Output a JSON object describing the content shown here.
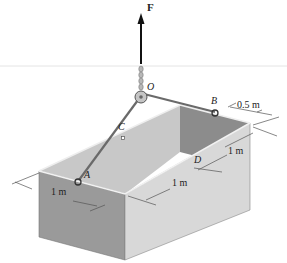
{
  "figure": {
    "force_label": "F",
    "points": {
      "O": "O",
      "A": "A",
      "B": "B",
      "C": "C",
      "D": "D"
    },
    "dimensions": {
      "offset_B": "0.5 m",
      "depth_right": "1 m",
      "length_front": "1 m",
      "width_left": "1 m"
    },
    "colors": {
      "front_face": "#9a9a9a",
      "right_face": "#d6d6d6",
      "inner_back": "#8c8c8c",
      "inner_left": "#c8c8c8",
      "rope": "#6a6a6a",
      "arrow": "#111111"
    }
  }
}
